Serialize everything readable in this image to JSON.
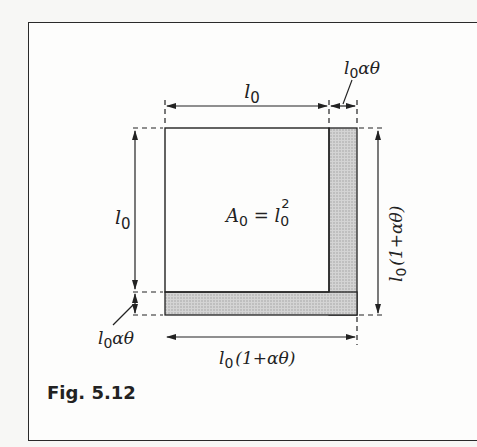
{
  "figure": {
    "caption": "Fig. 5.12",
    "labels": {
      "top_width": "l",
      "top_width_sub": "0",
      "expansion_top": "l",
      "expansion_top_sub": "0",
      "expansion_top_rest": "αθ",
      "left_height": "l",
      "left_height_sub": "0",
      "area_A": "A",
      "area_A_sub": "0",
      "area_eq": " = l",
      "area_l_sub": "0",
      "area_sup": "2",
      "right_height": "l",
      "right_height_sub": "0",
      "right_height_rest": "(1+αθ)",
      "expansion_left": "l",
      "expansion_left_sub": "0",
      "expansion_left_rest": "αθ",
      "bottom_width": "l",
      "bottom_width_sub": "0",
      "bottom_width_rest": "(1+αθ)"
    },
    "colors": {
      "line": "#222222",
      "shade": "#c8c8c8",
      "background": "#fdfdfc"
    }
  }
}
